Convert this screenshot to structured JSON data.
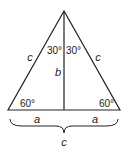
{
  "diagram": {
    "type": "geometry",
    "apex_angles": [
      "30°",
      "30°"
    ],
    "base_angles": [
      "60°",
      "60°"
    ],
    "side_labels": {
      "left": "c",
      "right": "c"
    },
    "altitude_label": "b",
    "base_half_labels": [
      "a",
      "a"
    ],
    "base_total_label": "c",
    "stroke_color": "#222222"
  }
}
